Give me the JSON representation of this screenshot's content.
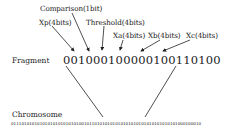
{
  "labels": {
    "comparison": "Comparison(1bit)",
    "xp": "Xp(4bits)",
    "threshold": "Threshold(4bits)",
    "xa": "Xa(4bits)",
    "xb": "Xb(4bits)",
    "xc": "Xc(4bits)"
  },
  "fragment": {
    "label": "Fragment",
    "bits": "001000100000100110100"
  },
  "chromosome": {
    "label": "Chromosome",
    "bits": "0111010101010101010101010100101101010101010101010101010101010101000100010"
  }
}
